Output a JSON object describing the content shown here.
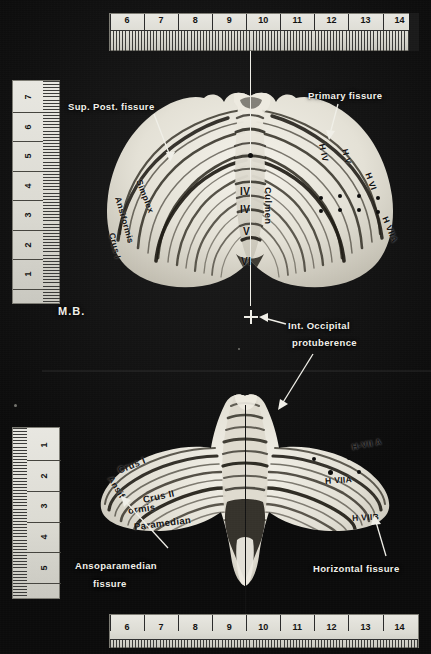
{
  "figure": {
    "type": "anatomical-photograph",
    "background_color": "#121212",
    "specimen_color": "#e9e7de"
  },
  "rulers": {
    "top": {
      "name": "top-horizontal-ruler",
      "orientation": "horizontal",
      "unit": "cm",
      "ticks": [
        "6",
        "7",
        "8",
        "9",
        "10",
        "11",
        "12",
        "13",
        "14"
      ],
      "range_start": 5.5,
      "range_end": 14.6
    },
    "bottom": {
      "name": "bottom-horizontal-ruler",
      "orientation": "horizontal",
      "unit": "cm",
      "ticks": [
        "6",
        "7",
        "8",
        "9",
        "10",
        "11",
        "12",
        "13",
        "14"
      ],
      "range_start": 5.5,
      "range_end": 14.6
    },
    "left_upper": {
      "name": "left-upper-vertical-ruler",
      "orientation": "vertical",
      "unit": "cm",
      "ticks": [
        "7",
        "6",
        "5",
        "4",
        "3",
        "2",
        "1"
      ]
    },
    "left_lower": {
      "name": "left-lower-vertical-ruler",
      "orientation": "vertical",
      "unit": "cm",
      "ticks": [
        "1",
        "2",
        "3",
        "4",
        "5"
      ]
    }
  },
  "upper_view": {
    "name": "superior-view",
    "annotations": {
      "sup_post_fissure": "Sup. Post. fissure",
      "primary_fissure": "Primary fissure",
      "simplex": "Simplex",
      "ansiformis": "Ansiformis",
      "crus_i": "Crus I",
      "h_iv": "H IV",
      "h_v": "H V",
      "h_vi": "H VI",
      "h_viia": "H VIIA",
      "vermis_iv_a": "IV",
      "vermis_iv_b": "IV",
      "vermis_v": "V",
      "vermis_vi": "VI",
      "culmen": "Culmen"
    }
  },
  "midline_marker": {
    "name": "internal-occipital-protuberance",
    "label_line1": "Int. Occipital",
    "label_line2": "protuberence"
  },
  "initials": {
    "name": "photographer-initials",
    "text": "M.B."
  },
  "lower_view": {
    "name": "inferior-view",
    "annotations": {
      "crus_i": "Crus I",
      "ansif": "Ansif",
      "crus_ii": "Crus II",
      "ormis": "ormis",
      "paramedian": "Paramedian",
      "h_vii_a_upper": "H-VII A",
      "h_viia": "H VIIA",
      "h_viib": "H VIIB",
      "ansoparamedian_line1": "Ansoparamedian",
      "ansoparamedian_line2": "fissure",
      "horizontal_fissure": "Horizontal fissure"
    }
  }
}
